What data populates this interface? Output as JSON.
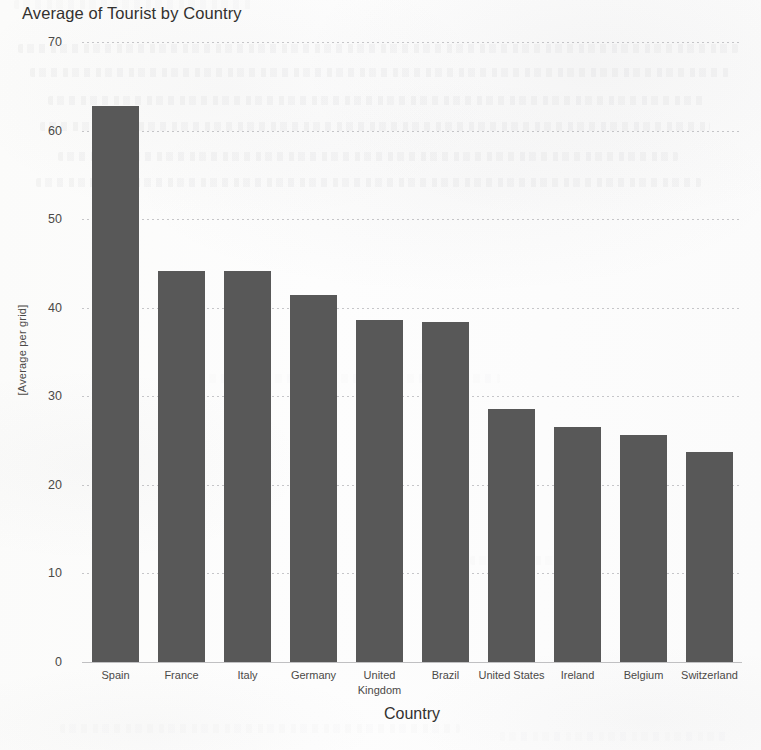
{
  "chart_data": {
    "type": "bar",
    "title": "Average of Tourist by Country",
    "xlabel": "Country",
    "ylabel": "[Average per grid]",
    "categories": [
      "Spain",
      "France",
      "Italy",
      "Germany",
      "United Kingdom",
      "Brazil",
      "United States",
      "Ireland",
      "Belgium",
      "Switzerland"
    ],
    "values": [
      62.8,
      44.1,
      44.1,
      41.4,
      38.6,
      38.4,
      28.6,
      26.5,
      25.6,
      23.7
    ],
    "ylim": [
      0,
      70
    ],
    "yticks": [
      0,
      10,
      20,
      30,
      40,
      50,
      60,
      70
    ],
    "ytick_labels": [
      "0",
      "10",
      "20",
      "30",
      "40",
      "50",
      "60",
      "70"
    ],
    "grid": true,
    "grid_axis": "y",
    "legend": "none",
    "bar_color": "#585858",
    "background_color": "#fdfdfc"
  }
}
